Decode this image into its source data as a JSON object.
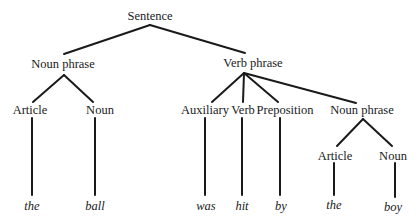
{
  "diagram": {
    "type": "syntax-tree",
    "root": {
      "label": "Sentence",
      "children": [
        {
          "label": "Noun phrase",
          "children": [
            {
              "label": "Article",
              "word": "the"
            },
            {
              "label": "Noun",
              "word": "ball"
            }
          ]
        },
        {
          "label": "Verb phrase",
          "children": [
            {
              "label": "Auxiliary",
              "word": "was"
            },
            {
              "label": "Verb",
              "word": "hit"
            },
            {
              "label": "Preposition",
              "word": "by"
            },
            {
              "label": "Noun phrase",
              "children": [
                {
                  "label": "Article",
                  "word": "the"
                },
                {
                  "label": "Noun",
                  "word": "boy"
                }
              ]
            }
          ]
        }
      ]
    }
  },
  "nodes": {
    "sentence": "Sentence",
    "np1": "Noun phrase",
    "np1_article": "Article",
    "np1_noun": "Noun",
    "vp": "Verb phrase",
    "vp_auxiliary": "Auxiliary",
    "vp_verb": "Verb",
    "vp_preposition": "Preposition",
    "np2": "Noun phrase",
    "np2_article": "Article",
    "np2_noun": "Noun"
  },
  "leaves": {
    "w1": "the",
    "w2": "ball",
    "w3": "was",
    "w4": "hit",
    "w5": "by",
    "w6": "the",
    "w7": "boy"
  },
  "colors": {
    "ink": "#1a1a1a",
    "background": "#ffffff"
  }
}
